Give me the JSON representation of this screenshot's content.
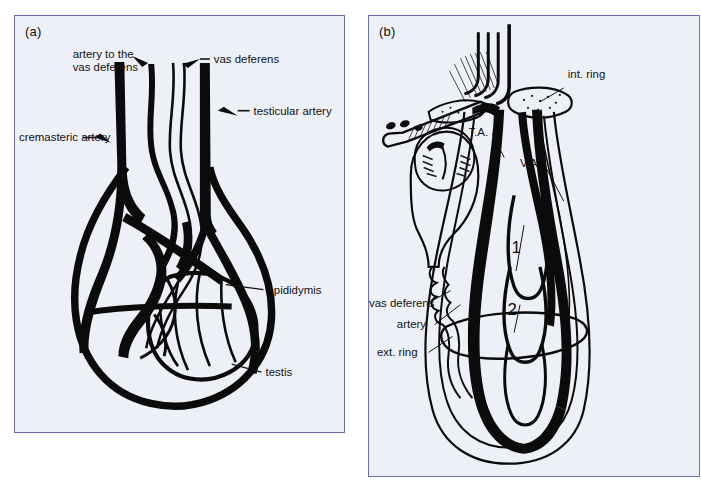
{
  "figure": {
    "background_color": "#ffffff",
    "panel_background": "#eef0f7",
    "panel_border_color": "#6b6fb0",
    "ink_color": "#0b0b0b"
  },
  "panels": [
    {
      "id": "a",
      "label": "(a)",
      "caption_labels": [
        {
          "name": "artery-to-vas-deferens",
          "text_line1": "artery to the",
          "text_line2": "vas deferens"
        },
        {
          "name": "vas-deferens",
          "text": "vas deferens"
        },
        {
          "name": "testicular-artery",
          "text": "testicular artery"
        },
        {
          "name": "cremasteric-artery",
          "text": "cremasteric artery"
        },
        {
          "name": "epididymis",
          "text": "epididymis"
        },
        {
          "name": "testis",
          "text": "testis"
        }
      ]
    },
    {
      "id": "b",
      "label": "(b)",
      "caption_labels": [
        {
          "name": "internal-ring",
          "text": "int. ring"
        },
        {
          "name": "testicular-artery-abbrev",
          "text": "T.A."
        },
        {
          "name": "vasal-artery-abbrev",
          "text": "V.A."
        },
        {
          "name": "vas-deferens",
          "text": "vas deferens"
        },
        {
          "name": "artery",
          "text": "artery"
        },
        {
          "name": "external-ring",
          "text": "ext. ring"
        },
        {
          "name": "marker-one",
          "text": "1"
        },
        {
          "name": "marker-two",
          "text": "2"
        }
      ]
    }
  ],
  "labels": {
    "a": {
      "panel": "(a)",
      "artery_to_the": "artery to the",
      "vas_deferens_2": "vas deferens",
      "vas_deferens": "vas deferens",
      "testicular_artery": "testicular artery",
      "cremasteric_artery": "cremasteric artery",
      "epididymis": "epididymis",
      "testis": "testis"
    },
    "b": {
      "panel": "(b)",
      "int_ring": "int. ring",
      "ta": "T.A.",
      "va": "V.A.",
      "vas_deferens": "vas deferens",
      "artery": "artery",
      "ext_ring": "ext. ring",
      "num1": "1",
      "num2": "2"
    }
  }
}
